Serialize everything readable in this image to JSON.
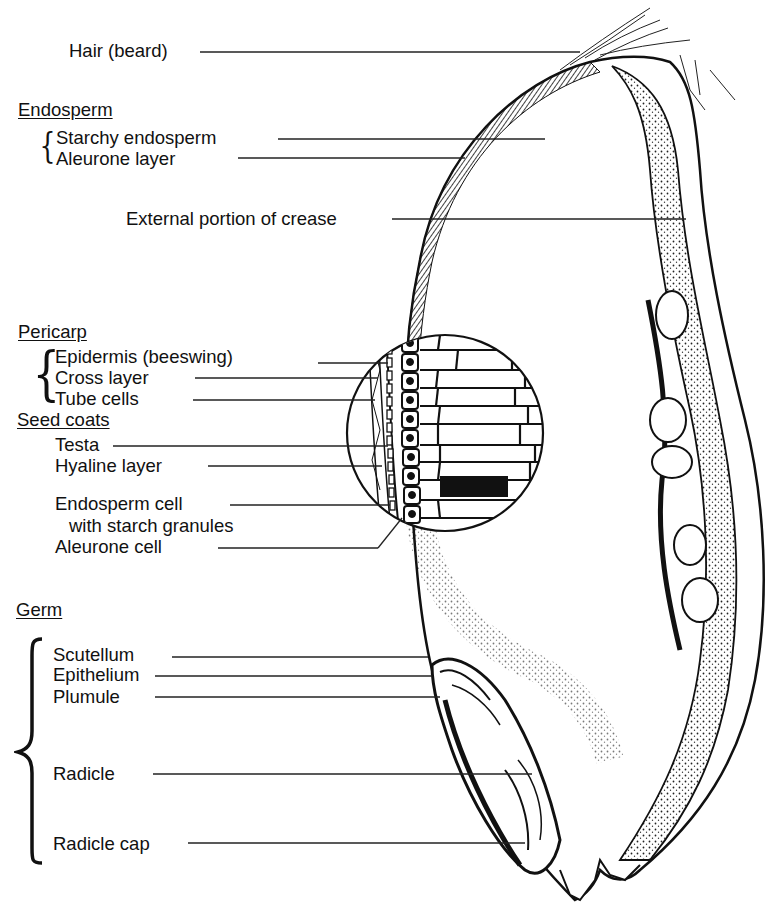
{
  "diagram": {
    "labels": {
      "hair": "Hair (beard)",
      "endosperm_heading": "Endosperm",
      "starchy_endosperm": "Starchy endosperm",
      "aleurone_layer": "Aleurone layer",
      "crease": "External portion of crease",
      "pericarp_heading": "Pericarp",
      "epidermis": "Epidermis (beeswing)",
      "cross_layer": "Cross layer",
      "tube_cells": "Tube cells",
      "seed_coats_heading": "Seed coats",
      "testa": "Testa",
      "hyaline_layer": "Hyaline layer",
      "endosperm_cell_line1": "Endosperm cell",
      "endosperm_cell_line2": "with starch granules",
      "aleurone_cell": "Aleurone cell",
      "germ_heading": "Germ",
      "scutellum": "Scutellum",
      "epithelium": "Epithelium",
      "plumule": "Plumule",
      "radicle": "Radicle",
      "radicle_cap": "Radicle cap"
    },
    "groups": [
      {
        "heading": "Endosperm",
        "items": [
          "Starchy endosperm",
          "Aleurone layer"
        ]
      },
      {
        "heading": "Pericarp",
        "items": [
          "Epidermis (beeswing)",
          "Cross layer",
          "Tube cells"
        ]
      },
      {
        "heading": "Seed coats",
        "items": [
          "Testa",
          "Hyaline layer",
          "Endosperm cell with starch granules",
          "Aleurone cell"
        ]
      },
      {
        "heading": "Germ",
        "items": [
          "Scutellum",
          "Epithelium",
          "Plumule",
          "Radicle",
          "Radicle cap"
        ]
      }
    ],
    "colors": {
      "ink": "#111111",
      "background": "#ffffff"
    }
  }
}
